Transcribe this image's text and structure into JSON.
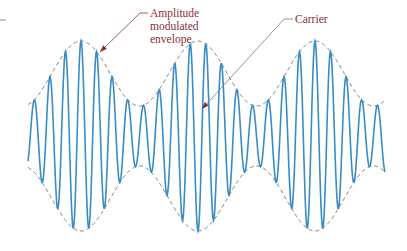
{
  "diagram": {
    "labels": {
      "envelope": [
        "Amplitude",
        "modulated",
        "envelope"
      ],
      "carrier": "Carrier"
    },
    "colors": {
      "carrier": "#3a8cc4",
      "envelope": "#6b6b6b",
      "label_text": "#8a2e35",
      "leader": "#8a2e35",
      "carrier_leader": "#7a7a7a",
      "corner_mark": "#9a9a9a"
    },
    "geometry": {
      "x_start": 28,
      "x_end": 385,
      "center_y": 136,
      "envelope_mean": 62.5,
      "envelope_depth": 32.5,
      "envelope_period": 117,
      "envelope_peak_x": 81,
      "carrier_period": 15.6,
      "carrier_phase_x": 81
    },
    "annotations": [
      {
        "id": "envelope",
        "text_x": 150,
        "text_y": 17,
        "line_height": 13,
        "leader": [
          [
            148,
            13
          ],
          [
            140,
            13
          ],
          [
            100,
            52
          ]
        ]
      },
      {
        "id": "carrier",
        "text_x": 295,
        "text_y": 23,
        "leader": [
          [
            293,
            19
          ],
          [
            284,
            19
          ],
          [
            202,
            109
          ]
        ]
      }
    ]
  }
}
